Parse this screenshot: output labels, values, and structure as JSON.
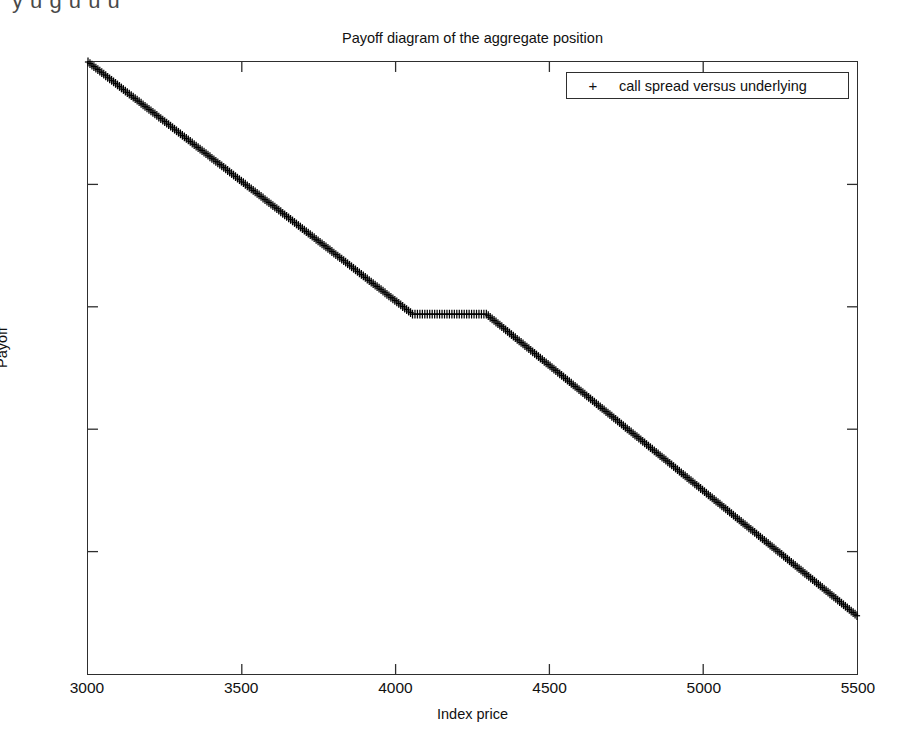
{
  "page_bleed_text": "y  u  g  u  u  u",
  "figure": {
    "title": "Payoff diagram of the aggregate position",
    "xlabel": "Index price",
    "ylabel": "Payoff",
    "legend": {
      "marker": "+",
      "label": "call spread versus underlying"
    }
  },
  "chart_data": {
    "type": "scatter",
    "title": "Payoff diagram of the aggregate position",
    "xlabel": "Index price",
    "ylabel": "Payoff",
    "xlim": [
      3000,
      5500
    ],
    "ylim": [
      -5500,
      -3000
    ],
    "xticks": [
      3000,
      3500,
      4000,
      4500,
      5000,
      5500
    ],
    "yticks": [
      -5500,
      -5000,
      -4500,
      -4000,
      -3500,
      -3000
    ],
    "xticklabels": [
      "3000",
      "3500",
      "4000",
      "4500",
      "5000",
      "5500"
    ],
    "yticklabels": [
      "-5500",
      "-5000",
      "-4500",
      "-4000",
      "-3500",
      "-3000"
    ],
    "grid": false,
    "legend_position": "upper right",
    "marker": "+",
    "color": "#000000",
    "series": [
      {
        "name": "call spread versus underlying",
        "description": "Piecewise-linear payoff: short underlying with a long call spread producing a flat plateau between the strikes.",
        "breakpoints": [
          {
            "x": 3000,
            "y": -3000
          },
          {
            "x": 4055,
            "y": -4030
          },
          {
            "x": 4295,
            "y": -4030
          },
          {
            "x": 5500,
            "y": -5262
          }
        ],
        "x": [
          3000,
          3100,
          3200,
          3300,
          3400,
          3500,
          3600,
          3700,
          3800,
          3900,
          4000,
          4055,
          4100,
          4200,
          4295,
          4400,
          4500,
          4600,
          4700,
          4800,
          4900,
          5000,
          5100,
          5200,
          5300,
          5400,
          5500
        ],
        "y": [
          -3000,
          -3098,
          -3195,
          -3293,
          -3391,
          -3488,
          -3586,
          -3684,
          -3781,
          -3879,
          -3976,
          -4030,
          -4030,
          -4030,
          -4030,
          -4137,
          -4240,
          -4342,
          -4444,
          -4546,
          -4648,
          -4751,
          -4853,
          -4955,
          -5057,
          -5159,
          -5262
        ]
      }
    ]
  }
}
